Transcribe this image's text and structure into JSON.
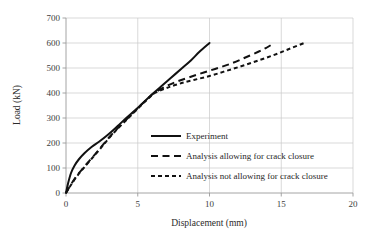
{
  "chart_data": {
    "type": "line",
    "title": "",
    "xlabel": "Displacement (mm)",
    "ylabel": "Load (kN)",
    "xlim": [
      0,
      20
    ],
    "ylim": [
      0,
      700
    ],
    "xticks": [
      "0",
      "5",
      "10",
      "15",
      "20"
    ],
    "xtick_values": [
      0,
      5,
      10,
      15,
      20
    ],
    "yticks": [
      "0",
      "100",
      "200",
      "300",
      "400",
      "500",
      "600",
      "700"
    ],
    "ytick_values": [
      0,
      100,
      200,
      300,
      400,
      500,
      600,
      700
    ],
    "grid": "horizontal-and-vertical",
    "legend_position": "center-right-inside",
    "series": [
      {
        "name": "Experiment",
        "style": "solid",
        "color": "#111111",
        "points": [
          [
            0.0,
            0
          ],
          [
            0.15,
            40
          ],
          [
            0.35,
            80
          ],
          [
            0.6,
            110
          ],
          [
            0.9,
            135
          ],
          [
            1.3,
            160
          ],
          [
            1.8,
            185
          ],
          [
            2.3,
            205
          ],
          [
            2.9,
            232
          ],
          [
            3.6,
            268
          ],
          [
            4.2,
            300
          ],
          [
            4.8,
            330
          ],
          [
            5.4,
            362
          ],
          [
            6.0,
            395
          ],
          [
            6.6,
            425
          ],
          [
            7.3,
            460
          ],
          [
            8.0,
            495
          ],
          [
            8.7,
            530
          ],
          [
            9.3,
            565
          ],
          [
            10.0,
            600
          ]
        ]
      },
      {
        "name": "Analysis allowing for crack closure",
        "style": "long-dash",
        "color": "#111111",
        "points": [
          [
            0.0,
            0
          ],
          [
            0.3,
            30
          ],
          [
            0.7,
            65
          ],
          [
            1.2,
            100
          ],
          [
            1.8,
            140
          ],
          [
            2.4,
            180
          ],
          [
            3.0,
            222
          ],
          [
            3.7,
            265
          ],
          [
            4.4,
            305
          ],
          [
            5.1,
            345
          ],
          [
            5.7,
            378
          ],
          [
            6.2,
            402
          ],
          [
            6.9,
            425
          ],
          [
            7.7,
            445
          ],
          [
            8.6,
            463
          ],
          [
            9.6,
            482
          ],
          [
            10.6,
            500
          ],
          [
            11.6,
            520
          ],
          [
            12.5,
            542
          ],
          [
            13.4,
            565
          ],
          [
            14.0,
            582
          ],
          [
            14.5,
            600
          ]
        ]
      },
      {
        "name": "Analysis not allowing for crack closure",
        "style": "short-dash",
        "color": "#111111",
        "points": [
          [
            0.0,
            0
          ],
          [
            0.3,
            28
          ],
          [
            0.7,
            62
          ],
          [
            1.2,
            98
          ],
          [
            1.8,
            138
          ],
          [
            2.4,
            178
          ],
          [
            3.0,
            220
          ],
          [
            3.7,
            263
          ],
          [
            4.4,
            303
          ],
          [
            5.1,
            343
          ],
          [
            5.7,
            376
          ],
          [
            6.2,
            400
          ],
          [
            7.0,
            420
          ],
          [
            7.9,
            437
          ],
          [
            8.9,
            452
          ],
          [
            10.0,
            468
          ],
          [
            11.1,
            487
          ],
          [
            12.2,
            507
          ],
          [
            13.3,
            528
          ],
          [
            14.4,
            550
          ],
          [
            15.5,
            575
          ],
          [
            16.6,
            600
          ]
        ]
      }
    ],
    "legend": [
      {
        "label": "Experiment",
        "style": "solid"
      },
      {
        "label": "Analysis allowing for crack closure",
        "style": "long-dash"
      },
      {
        "label": "Analysis not allowing for crack closure",
        "style": "short-dash"
      }
    ]
  }
}
